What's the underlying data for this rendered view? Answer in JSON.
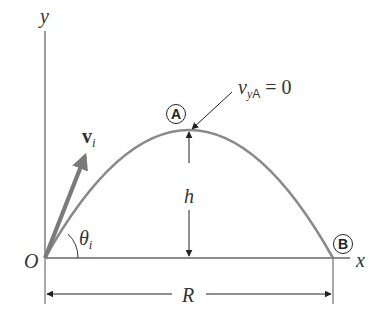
{
  "diagram": {
    "colors": {
      "trajectory": "#8a8a8a",
      "axes": "#555555",
      "velocity_vector": "#7a7a7a",
      "annotation": "#222222",
      "background": "#ffffff"
    },
    "axes": {
      "x_label": "x",
      "y_label": "y",
      "origin_label": "O"
    },
    "points": {
      "apex": {
        "marker": "A",
        "note_var": "v",
        "note_sub_y": "y",
        "note_sub_point": "A",
        "note_eq": "= 0"
      },
      "landing": {
        "marker": "B"
      }
    },
    "vectors": {
      "initial_velocity": {
        "symbol": "v",
        "subscript": "i"
      }
    },
    "angles": {
      "launch": {
        "symbol": "θ",
        "subscript": "i"
      }
    },
    "dimensions": {
      "height": {
        "label": "h"
      },
      "range": {
        "label": "R"
      }
    }
  }
}
